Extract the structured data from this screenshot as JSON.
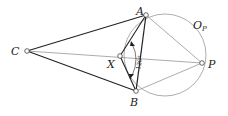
{
  "diagram": {
    "points": {
      "A": {
        "label": "A",
        "x": 146,
        "y": 15
      },
      "B": {
        "label": "B",
        "x": 136,
        "y": 91
      },
      "C": {
        "label": "C",
        "x": 27,
        "y": 51
      },
      "X": {
        "label": "X",
        "x": 120,
        "y": 56
      },
      "P": {
        "label": "P",
        "x": 202,
        "y": 63
      }
    },
    "circle": {
      "label": "O",
      "subscript": "P"
    },
    "angle_label": "120°",
    "colors": {
      "thick": "#222222",
      "thin": "#888888",
      "circle": "#999999"
    }
  }
}
